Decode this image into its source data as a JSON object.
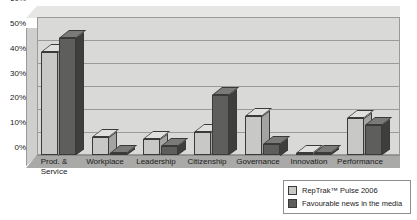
{
  "chart_data": {
    "type": "bar",
    "title": "",
    "xlabel": "",
    "ylabel": "",
    "ylim": [
      0,
      60
    ],
    "ytick_labels": [
      "0%",
      "10%",
      "20%",
      "30%",
      "40%",
      "50%",
      "60%"
    ],
    "ytick_values": [
      0,
      10,
      20,
      30,
      40,
      50,
      60
    ],
    "grid": true,
    "legend_position": "bottom-right",
    "style": "3d-column",
    "categories": [
      "Prod. & Service",
      "Workplace",
      "Leadership",
      "Citizenship",
      "Governance",
      "Innovation",
      "Performance"
    ],
    "series": [
      {
        "name": "RepTrak™ Pulse 2006",
        "color": "#c8c8c6",
        "values": [
          45,
          8,
          7,
          10,
          17,
          1,
          16
        ]
      },
      {
        "name": "Favourable news in the media",
        "color": "#5e5e5c",
        "values": [
          51,
          1,
          4,
          26,
          5,
          1,
          13
        ]
      }
    ]
  },
  "axis": {
    "y_ticks": [
      {
        "label": "60%",
        "value": 60
      },
      {
        "label": "50%",
        "value": 50
      },
      {
        "label": "40%",
        "value": 40
      },
      {
        "label": "30%",
        "value": 30
      },
      {
        "label": "20%",
        "value": 20
      },
      {
        "label": "10%",
        "value": 10
      },
      {
        "label": "0%",
        "value": 0
      }
    ],
    "x_labels": [
      {
        "line1": "Prod. &",
        "line2": "Service"
      },
      {
        "line1": "Workplace",
        "line2": ""
      },
      {
        "line1": "Leadership",
        "line2": ""
      },
      {
        "line1": "Citizenship",
        "line2": ""
      },
      {
        "line1": "Governance",
        "line2": ""
      },
      {
        "line1": "Innovation",
        "line2": ""
      },
      {
        "line1": "Performance",
        "line2": ""
      }
    ]
  },
  "legend": {
    "items": [
      {
        "label": "RepTrak™ Pulse 2006",
        "color": "#c8c8c6"
      },
      {
        "label": "Favourable news in the media",
        "color": "#5e5e5c"
      }
    ]
  }
}
